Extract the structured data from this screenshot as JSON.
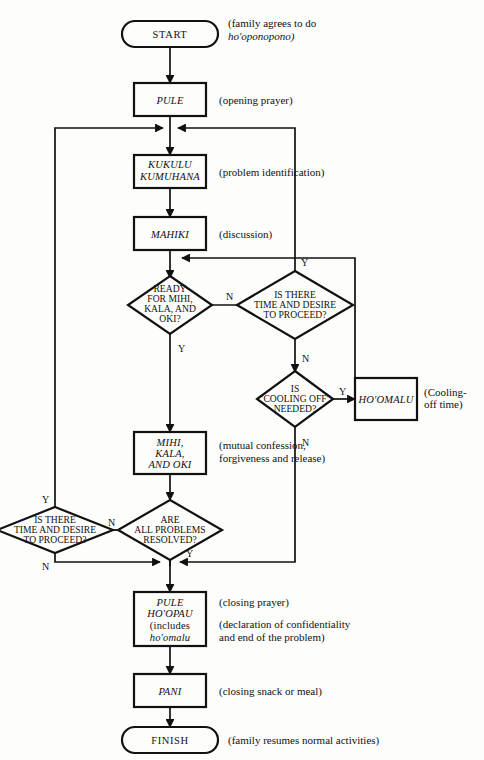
{
  "diagram": {
    "stroke_color": "#111111",
    "background_color": "#fdfdfb"
  },
  "nodes": {
    "start": {
      "label": "START",
      "type": "terminator"
    },
    "pule": {
      "label": "PULE",
      "type": "process"
    },
    "kukulu": {
      "line1": "KUKULU",
      "line2": "KUMUHANA",
      "type": "process"
    },
    "mahiki": {
      "label": "MAHIKI",
      "type": "process"
    },
    "ready": {
      "line1": "READY",
      "line2": "FOR MIHI,",
      "line3": "KALA, AND",
      "line4": "OKI?",
      "type": "decision"
    },
    "time_top": {
      "line1": "IS THERE",
      "line2": "TIME AND DESIRE",
      "line3": "TO PROCEED?",
      "type": "decision"
    },
    "cooling": {
      "line1": "IS",
      "line2": "\"COOLING OFF\"",
      "line3": "NEEDED?",
      "type": "decision"
    },
    "hoomalu": {
      "label": "HO'OMALU",
      "type": "process"
    },
    "mihi": {
      "line1": "MIHI,",
      "line2": "KALA,",
      "line3": "AND OKI",
      "type": "process"
    },
    "resolved": {
      "line1": "ARE",
      "line2": "ALL PROBLEMS",
      "line3": "RESOLVED?",
      "type": "decision"
    },
    "time_bottom": {
      "line1": "IS THERE",
      "line2": "TIME AND DESIRE",
      "line3": "TO PROCEED?",
      "type": "decision"
    },
    "pule_hoopau": {
      "line1": "PULE",
      "line2": "HO'OPAU",
      "line3": "(includes",
      "line4": "ho'omalu",
      "type": "process"
    },
    "pani": {
      "label": "PANI",
      "type": "process"
    },
    "finish": {
      "label": "FINISH",
      "type": "terminator"
    }
  },
  "annotations": {
    "start_1": "(family agrees to do",
    "start_2": "ho'oponopono)",
    "pule": "(opening prayer)",
    "kukulu": "(problem identification)",
    "mahiki": "(discussion)",
    "hoomalu_1": "(Cooling-",
    "hoomalu_2": "off time)",
    "mihi_1": "(mutual confession,",
    "mihi_2": "forgiveness and release)",
    "pule_hoopau_1": "(closing prayer)",
    "pule_hoopau_2": "(declaration of confidentiality",
    "pule_hoopau_3": "and end of the problem)",
    "pani": "(closing snack or meal)",
    "finish": "(family resumes normal activities)"
  },
  "edge_labels": {
    "ready_no": "N",
    "ready_yes": "Y",
    "time_top_yes": "Y",
    "time_top_no": "N",
    "cooling_yes": "Y",
    "cooling_no": "N",
    "resolved_no": "N",
    "resolved_yes": "Y",
    "time_bottom_yes": "Y",
    "time_bottom_no": "N"
  }
}
